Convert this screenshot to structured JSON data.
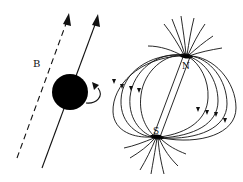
{
  "figure": {
    "colors": {
      "ink": "#111111",
      "background": "#ffffff"
    },
    "left_panel": {
      "field_label": "B",
      "field_line_style": "dashed",
      "spin_axis_style": "solid",
      "particle": "filled-sphere",
      "rotation_arrow": "curved-arrow"
    },
    "right_panel": {
      "north_label": "N",
      "south_label": "S",
      "field_type": "dipole"
    }
  }
}
